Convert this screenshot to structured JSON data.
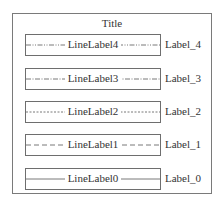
{
  "title": "Title",
  "rows": [
    {
      "line_label": "LineLabel4",
      "side_label": "Label_4",
      "line_style": "dash-dot-dot",
      "dasharray": "5 1.5 1 1.5 1 1.5"
    },
    {
      "line_label": "LineLabel3",
      "side_label": "Label_3",
      "line_style": "dash-dot",
      "dasharray": "5 1.5 1 1.5"
    },
    {
      "line_label": "LineLabel2",
      "side_label": "Label_2",
      "line_style": "dotted",
      "dasharray": "2 1.5"
    },
    {
      "line_label": "LineLabel1",
      "side_label": "Label_1",
      "line_style": "dashed",
      "dasharray": "5 3"
    },
    {
      "line_label": "LineLabel0",
      "side_label": "Label_0",
      "line_style": "solid",
      "dasharray": ""
    }
  ],
  "colors": {
    "frame": "#7a7a7a",
    "box_border": "#6e6e6e",
    "line": "#555555",
    "text": "#333333"
  }
}
